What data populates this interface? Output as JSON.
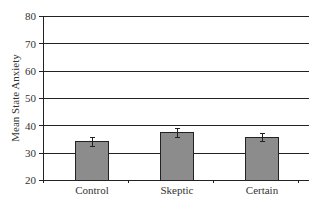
{
  "chart_data": {
    "type": "bar",
    "title": "",
    "xlabel": "",
    "ylabel": "Mean State Anxiety",
    "categories": [
      "Control",
      "Skeptic",
      "Certain"
    ],
    "values": [
      34.1,
      37.4,
      35.6
    ],
    "error": [
      1.5,
      1.5,
      1.5
    ],
    "ylim": [
      20,
      80
    ],
    "yticks": [
      20,
      30,
      40,
      50,
      60,
      70,
      80
    ],
    "grid": true,
    "legend": null,
    "bar_color": "#8c8c8c"
  },
  "axis": {
    "ylabel": "Mean State Anxiety",
    "yticks": [
      "80",
      "70",
      "60",
      "50",
      "40",
      "30",
      "20"
    ],
    "categories": [
      "Control",
      "Skeptic",
      "Certain"
    ]
  }
}
